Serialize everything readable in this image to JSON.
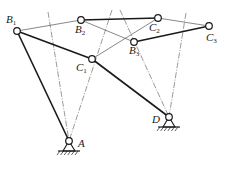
{
  "diagram": {
    "title": "",
    "type": "four-bar linkage synthesis (three positions)",
    "colors": {
      "ink": "#1a1a1a",
      "thin": "#555555",
      "bg": "#ffffff"
    },
    "points": {
      "A": {
        "x": 69,
        "y": 141,
        "label": "A",
        "sub": ""
      },
      "D": {
        "x": 169,
        "y": 117,
        "label": "D",
        "sub": ""
      },
      "B1": {
        "x": 17,
        "y": 31,
        "label": "B",
        "sub": "1"
      },
      "B2": {
        "x": 81,
        "y": 20,
        "label": "B",
        "sub": "2"
      },
      "B3": {
        "x": 134,
        "y": 42,
        "label": "B",
        "sub": "3"
      },
      "C1": {
        "x": 92,
        "y": 59,
        "label": "C",
        "sub": "1"
      },
      "C2": {
        "x": 158,
        "y": 18,
        "label": "C",
        "sub": "2"
      },
      "C3": {
        "x": 209,
        "y": 26,
        "label": "C",
        "sub": "3"
      }
    },
    "labels": [
      {
        "id": "B1",
        "text": "B",
        "sub": "1",
        "x": 6,
        "y": 14
      },
      {
        "id": "B2",
        "text": "B",
        "sub": "2",
        "x": 75,
        "y": 24
      },
      {
        "id": "B3",
        "text": "B",
        "sub": "3",
        "x": 129,
        "y": 45
      },
      {
        "id": "C1",
        "text": "C",
        "sub": "1",
        "x": 76,
        "y": 62
      },
      {
        "id": "C2",
        "text": "C",
        "sub": "2",
        "x": 149,
        "y": 22
      },
      {
        "id": "C3",
        "text": "C",
        "sub": "3",
        "x": 206,
        "y": 32
      },
      {
        "id": "A",
        "text": "A",
        "sub": "",
        "x": 78,
        "y": 138
      },
      {
        "id": "D",
        "text": "D",
        "sub": "",
        "x": 152,
        "y": 114
      }
    ],
    "links_thick": [
      [
        "A",
        "B1"
      ],
      [
        "B1",
        "C1"
      ],
      [
        "C1",
        "D"
      ],
      [
        "B2",
        "C2"
      ],
      [
        "B3",
        "C3"
      ]
    ],
    "links_thin": [
      [
        "B1",
        "B2"
      ],
      [
        "B2",
        "B3"
      ],
      [
        "C1",
        "C2"
      ],
      [
        "C2",
        "C3"
      ]
    ],
    "bisectors": [
      {
        "from": [
          48,
          12
        ],
        "to": "A"
      },
      {
        "from": [
          112,
          10
        ],
        "to": "A"
      },
      {
        "from": [
          120,
          10
        ],
        "to": "D"
      },
      {
        "from": [
          186,
          13
        ],
        "to": "D"
      }
    ],
    "grounds": [
      "A",
      "D"
    ]
  }
}
